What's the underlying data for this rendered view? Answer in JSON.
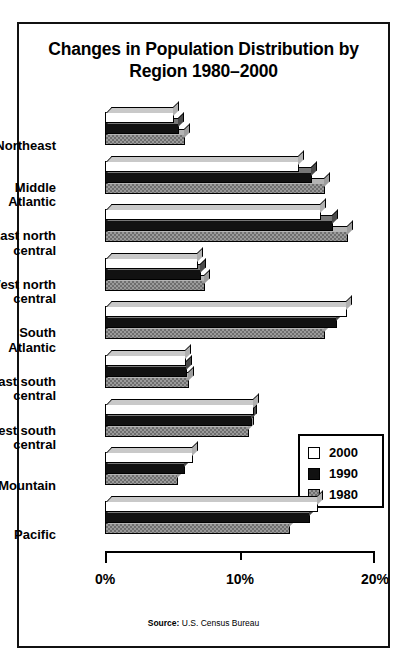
{
  "title": "Changes in Population Distribution\nby Region 1980–2000",
  "source": {
    "prefix": "Source:",
    "text": " U.S. Census Bureau"
  },
  "legend": {
    "position": "inside-right",
    "entries": [
      {
        "label": "2000",
        "swatch": "white",
        "color": "#ffffff"
      },
      {
        "label": "1990",
        "swatch": "black",
        "color": "#111111"
      },
      {
        "label": "1980",
        "swatch": "gray-hatched",
        "color": "#9a9a9a"
      }
    ]
  },
  "chart_data": {
    "type": "bar",
    "orientation": "horizontal",
    "title": "Changes in Population Distribution by Region 1980–2000",
    "xlabel": "",
    "ylabel": "",
    "xlim": [
      0,
      20
    ],
    "xticks": [
      0,
      10,
      20
    ],
    "xticklabels": [
      "0%",
      "10%",
      "20%"
    ],
    "grid": false,
    "legend_position": "inside-right",
    "units": "percent of U.S. population",
    "categories": [
      "Northeast",
      "Middle\nAtlantic",
      "East north\ncentral",
      "West north\ncentral",
      "South\nAtlantic",
      "East south\ncentral",
      "West south\ncentral",
      "Mountain",
      "Pacific"
    ],
    "series": [
      {
        "name": "2000",
        "values": [
          5.1,
          14.4,
          16.0,
          6.9,
          17.9,
          6.0,
          11.0,
          6.5,
          15.8
        ]
      },
      {
        "name": "1990",
        "values": [
          5.5,
          15.3,
          16.9,
          7.1,
          17.2,
          6.1,
          10.9,
          5.9,
          15.2
        ]
      },
      {
        "name": "1980",
        "values": [
          5.9,
          16.3,
          18.0,
          7.4,
          16.3,
          6.2,
          10.7,
          5.4,
          13.7
        ]
      }
    ]
  }
}
